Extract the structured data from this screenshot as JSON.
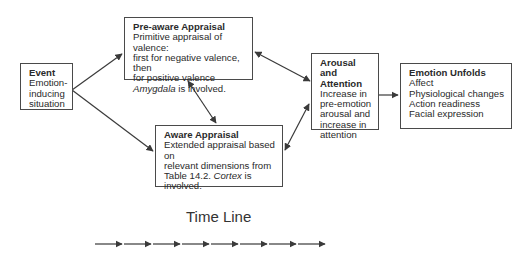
{
  "diagram": {
    "boxes": {
      "event": {
        "title": "Event",
        "lines": [
          "Emotion-",
          "inducing",
          "situation"
        ]
      },
      "pre_aware": {
        "title": "Pre-aware Appraisal",
        "lines": [
          "Primitive appraisal of valence:",
          "first for negative valence, then",
          "for positive valence"
        ],
        "italic_term": "Amygdala",
        "tail": " is involved."
      },
      "aware": {
        "title": "Aware Appraisal",
        "lines": [
          "Extended appraisal based on",
          "relevant dimensions from"
        ],
        "line3_prefix": "Table 14.2. ",
        "italic_term": "Cortex",
        "line3_suffix": " is",
        "line4": "involved."
      },
      "arousal": {
        "title_line1": "Arousal and",
        "title_line2": "Attention",
        "lines": [
          "Increase in",
          "pre-emotion",
          "arousal and",
          "increase in",
          "attention"
        ]
      },
      "emotion": {
        "title": "Emotion Unfolds",
        "lines": [
          "Affect",
          "Physiological changes",
          "Action readiness",
          "Facial expression"
        ]
      }
    },
    "connections": [
      {
        "from": "event",
        "to": "pre_aware",
        "type": "single"
      },
      {
        "from": "event",
        "to": "aware",
        "type": "single"
      },
      {
        "from": "pre_aware",
        "to": "aware",
        "type": "double"
      },
      {
        "from": "pre_aware",
        "to": "arousal",
        "type": "double"
      },
      {
        "from": "aware",
        "to": "arousal",
        "type": "double"
      },
      {
        "from": "arousal",
        "to": "emotion",
        "type": "single"
      }
    ],
    "timeline": {
      "label": "Time Line",
      "arrow_count": 8
    },
    "colors": {
      "line": "#3a3a3a",
      "text": "#2a2a2a",
      "background": "#ffffff"
    }
  }
}
